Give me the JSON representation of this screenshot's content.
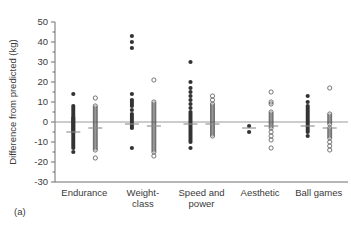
{
  "figure": {
    "panel_label": "(a)",
    "width": 351,
    "height": 225
  },
  "chart_data": {
    "type": "scatter",
    "title": "",
    "xlabel": "",
    "ylabel": "Difference from predicted (kg)",
    "ylim": [
      -30,
      50
    ],
    "yticks": [
      50,
      40,
      30,
      20,
      10,
      0,
      -10,
      -20,
      -30
    ],
    "ytick_labels": [
      "50",
      "40",
      "30",
      "20",
      "10",
      "0",
      "-10",
      "-20",
      "-30"
    ],
    "minor_tick_step": 5,
    "grid": false,
    "legend_position": "none",
    "reference_line": 0,
    "categories": [
      "Endurance",
      "Weight-class",
      "Speed and power",
      "Aesthetic",
      "Ball games"
    ],
    "category_lines": [
      [
        "Endurance"
      ],
      [
        "Weight-",
        "class"
      ],
      [
        "Speed and",
        "power"
      ],
      [
        "Aesthetic"
      ],
      [
        "Ball games"
      ]
    ],
    "series": [
      {
        "name": "closed",
        "marker": "filled-circle",
        "color": "#333333",
        "groups": [
          {
            "category": "Endurance",
            "mean": -5,
            "values": [
              14,
              8,
              7,
              6,
              5,
              4,
              3,
              2,
              2,
              1,
              1,
              0,
              0,
              -1,
              -1,
              -2,
              -2,
              -3,
              -3,
              -4,
              -4,
              -5,
              -5,
              -6,
              -7,
              -8,
              -9,
              -10,
              -11,
              -12,
              -13,
              -15
            ]
          },
          {
            "category": "Weight-class",
            "mean": -1,
            "values": [
              43,
              40,
              37,
              14,
              11,
              10,
              9,
              8,
              6,
              4,
              3,
              2,
              1,
              0,
              -1,
              -2,
              -3,
              -13
            ]
          },
          {
            "category": "Speed and power",
            "mean": -1,
            "values": [
              30,
              20,
              17,
              15,
              13,
              11,
              9,
              7,
              5,
              4,
              3,
              2,
              1,
              0,
              -1,
              -2,
              -3,
              -4,
              -5,
              -6,
              -7,
              -8,
              -9,
              -10,
              -13
            ]
          },
          {
            "category": "Aesthetic",
            "mean": -3,
            "values": [
              -2,
              -5
            ]
          },
          {
            "category": "Ball games",
            "mean": -2,
            "values": [
              13,
              10,
              8,
              7,
              6,
              5,
              4,
              3,
              2,
              1,
              0,
              -1,
              -2,
              -3,
              -4,
              -5,
              -7
            ]
          }
        ]
      },
      {
        "name": "open",
        "marker": "open-circle",
        "color": "#555555",
        "groups": [
          {
            "category": "Endurance",
            "mean": -3,
            "values": [
              12,
              8,
              7,
              6,
              5,
              4,
              3,
              2,
              1,
              0,
              -1,
              -2,
              -3,
              -4,
              -5,
              -6,
              -7,
              -8,
              -9,
              -10,
              -11,
              -12,
              -13,
              -14,
              -18
            ]
          },
          {
            "category": "Weight-class",
            "mean": -2,
            "values": [
              21,
              10,
              9,
              8,
              7,
              6,
              5,
              4,
              3,
              2,
              1,
              0,
              -1,
              -2,
              -3,
              -4,
              -5,
              -6,
              -7,
              -8,
              -9,
              -10,
              -11,
              -12,
              -13,
              -14,
              -15,
              -17
            ]
          },
          {
            "category": "Speed and power",
            "mean": -1,
            "values": [
              13,
              11,
              9,
              8,
              7,
              6,
              5,
              4,
              3,
              2,
              1,
              0,
              -1,
              -2,
              -3,
              -4,
              -5,
              -6,
              -7
            ]
          },
          {
            "category": "Aesthetic",
            "mean": -2,
            "values": [
              15,
              10,
              9,
              5,
              4,
              3,
              2,
              1,
              0,
              -1,
              -2,
              -3,
              -5,
              -7,
              -9,
              -13
            ]
          },
          {
            "category": "Ball games",
            "mean": -3,
            "values": [
              17,
              4,
              3,
              2,
              1,
              0,
              -1,
              -3,
              -4,
              -5,
              -6,
              -7,
              -8,
              -10,
              -12,
              -14
            ]
          }
        ]
      }
    ]
  }
}
